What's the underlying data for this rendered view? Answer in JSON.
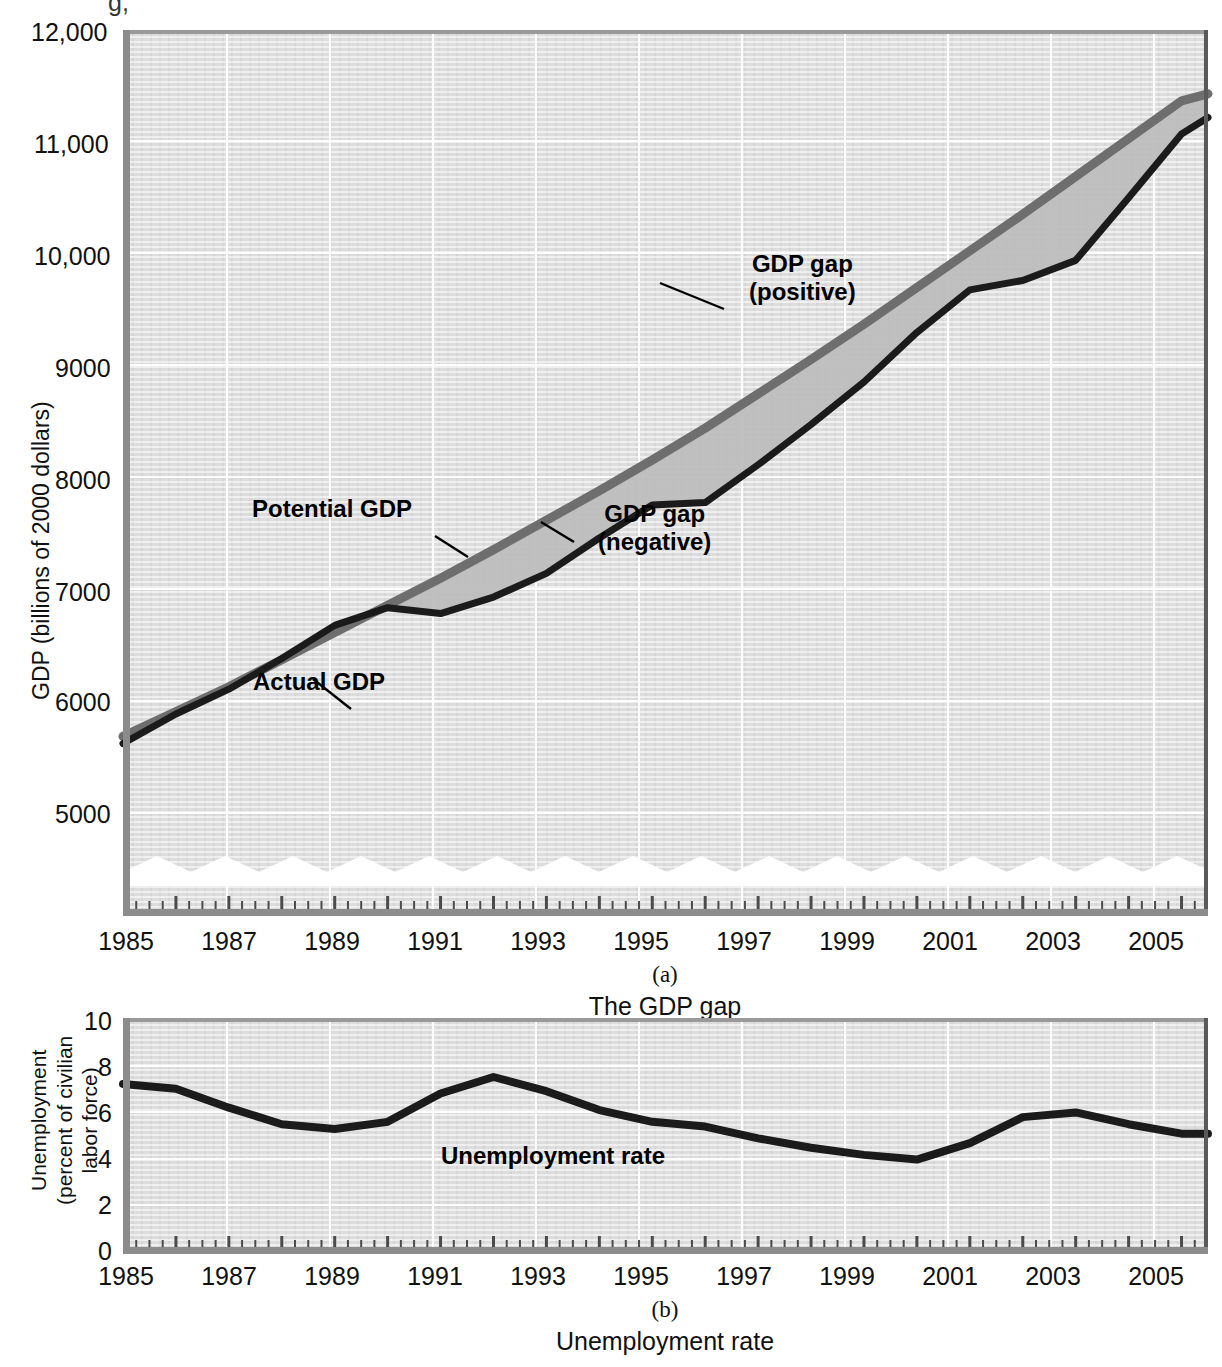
{
  "figure": {
    "top_partial_glyph": "g,"
  },
  "panel_a": {
    "letter": "(a)",
    "caption": "The GDP gap",
    "y_axis_title": "GDP (billions of 2000 dollars)",
    "y_ticks": [
      "12,000",
      "11,000",
      "10,000",
      "9000",
      "8000",
      "7000",
      "6000",
      "5000"
    ],
    "x_ticks": [
      "1985",
      "1987",
      "1989",
      "1991",
      "1993",
      "1995",
      "1997",
      "1999",
      "2001",
      "2003",
      "2005"
    ],
    "annotations": {
      "potential": "Potential GDP",
      "actual": "Actual GDP",
      "gap_negative_l1": "GDP gap",
      "gap_negative_l2": "(negative)",
      "gap_positive_l1": "GDP gap",
      "gap_positive_l2": "(positive)"
    },
    "colors": {
      "potential_line": "#6e6e6e",
      "actual_line": "#1b1b1b",
      "gap_fill": "#b9b9b9",
      "plot_bg": "#dddddd"
    },
    "axis_break": true
  },
  "panel_b": {
    "letter": "(b)",
    "caption": "Unemployment rate",
    "y_axis_title_l1": "Unemployment",
    "y_axis_title_l2": "(percent of civilian",
    "y_axis_title_l3": "labor force)",
    "y_ticks": [
      "10",
      "8",
      "6",
      "4",
      "2",
      "0"
    ],
    "x_ticks": [
      "1985",
      "1987",
      "1989",
      "1991",
      "1993",
      "1995",
      "1997",
      "1999",
      "2001",
      "2003",
      "2005"
    ],
    "annotations": {
      "series": "Unemployment rate"
    },
    "colors": {
      "line": "#1b1b1b",
      "plot_bg": "#dcdcdc"
    }
  },
  "chart_data": [
    {
      "type": "line",
      "id": "gdp-gap",
      "title": "The GDP gap",
      "xlabel": "",
      "ylabel": "GDP (billions of 2000 dollars)",
      "xlim": [
        1985,
        2005.5
      ],
      "ylim": [
        4500,
        12000
      ],
      "ytick_values": [
        5000,
        6000,
        7000,
        8000,
        9000,
        10000,
        11000,
        12000
      ],
      "xtick_values": [
        1985,
        1987,
        1989,
        1991,
        1993,
        1995,
        1997,
        1999,
        2001,
        2003,
        2005
      ],
      "axis_break_below": 4800,
      "grid": true,
      "legend": "inline-annotations",
      "series": [
        {
          "name": "Potential GDP",
          "color": "#6e6e6e",
          "x": [
            1985,
            1986,
            1987,
            1988,
            1989,
            1990,
            1991,
            1992,
            1993,
            1994,
            1995,
            1996,
            1997,
            1998,
            1999,
            2000,
            2001,
            2002,
            2003,
            2004,
            2005,
            2005.5
          ],
          "values": [
            6020,
            6230,
            6440,
            6670,
            6900,
            7130,
            7360,
            7600,
            7850,
            8100,
            8360,
            8630,
            8920,
            9210,
            9510,
            9820,
            10130,
            10440,
            10760,
            11080,
            11400,
            11460
          ]
        },
        {
          "name": "Actual GDP",
          "color": "#1b1b1b",
          "x": [
            1985,
            1986,
            1987,
            1988,
            1989,
            1990,
            1991,
            1992,
            1993,
            1994,
            1995,
            1996,
            1997,
            1998,
            1999,
            2000,
            2001,
            2002,
            2003,
            2004,
            2005,
            2005.5
          ],
          "values": [
            5960,
            6210,
            6420,
            6680,
            6960,
            7110,
            7060,
            7200,
            7400,
            7700,
            7980,
            8000,
            8320,
            8660,
            9020,
            9440,
            9800,
            9880,
            10050,
            10580,
            11120,
            11260
          ]
        }
      ],
      "gap_regions": [
        {
          "name": "GDP gap (negative)",
          "from": 1990.2,
          "to": 1996.8,
          "meaning": "actual below potential"
        },
        {
          "name": "GDP gap (positive)",
          "from": 1996.8,
          "to": 2000.9,
          "meaning": "actual above potential"
        },
        {
          "name": "GDP gap (negative)",
          "from": 2000.9,
          "to": 2005.5,
          "meaning": "actual below potential"
        }
      ]
    },
    {
      "type": "line",
      "id": "unemployment-rate",
      "title": "Unemployment rate",
      "xlabel": "",
      "ylabel": "Unemployment (percent of civilian labor force)",
      "xlim": [
        1985,
        2005.5
      ],
      "ylim": [
        0,
        10
      ],
      "ytick_values": [
        0,
        2,
        4,
        6,
        8,
        10
      ],
      "xtick_values": [
        1985,
        1987,
        1989,
        1991,
        1993,
        1995,
        1997,
        1999,
        2001,
        2003,
        2005
      ],
      "grid": true,
      "series": [
        {
          "name": "Unemployment rate",
          "color": "#1b1b1b",
          "x": [
            1985,
            1986,
            1987,
            1988,
            1989,
            1990,
            1991,
            1992,
            1993,
            1994,
            1995,
            1996,
            1997,
            1998,
            1999,
            2000,
            2001,
            2002,
            2003,
            2004,
            2005,
            2005.5
          ],
          "values": [
            7.2,
            7.0,
            6.2,
            5.5,
            5.3,
            5.6,
            6.8,
            7.5,
            6.9,
            6.1,
            5.6,
            5.4,
            4.9,
            4.5,
            4.2,
            4.0,
            4.7,
            5.8,
            6.0,
            5.5,
            5.1,
            5.1
          ]
        }
      ]
    }
  ]
}
